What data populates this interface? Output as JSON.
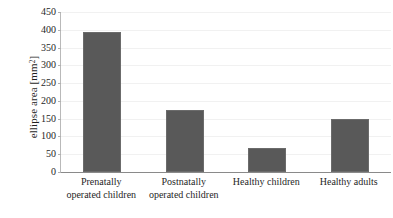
{
  "chart_data": {
    "type": "bar",
    "title": "",
    "subtitle": "",
    "xlabel": "",
    "ylabel": "ellipse area [mm2]",
    "ylabel_base": "ellipse area [mm",
    "ylabel_sup": "2",
    "ylabel_close": "]",
    "categories": [
      "Prenatally operated children",
      "Postnatally operated children",
      "Healthy children",
      "Healthy adults"
    ],
    "category_lines": [
      [
        "Prenatally",
        "operated children"
      ],
      [
        "Postnatally",
        "operated children"
      ],
      [
        "Healthy children"
      ],
      [
        "Healthy adults"
      ]
    ],
    "values": [
      393,
      175,
      67,
      150
    ],
    "ylim": [
      0,
      450
    ],
    "ytick_step": 50,
    "yticks": [
      0,
      50,
      100,
      150,
      200,
      250,
      300,
      350,
      400,
      450
    ],
    "ytick_labels": [
      "0",
      "50",
      "100",
      "150",
      "200",
      "250",
      "300",
      "350",
      "400",
      "450"
    ],
    "grid": true,
    "grid_axis": "y",
    "legend": false,
    "legend_position": "none",
    "bar_color": "#595959",
    "background_color": "#ffffff",
    "gridline_color": "#f1f1f1",
    "axis_color": "#8a8a8a"
  }
}
